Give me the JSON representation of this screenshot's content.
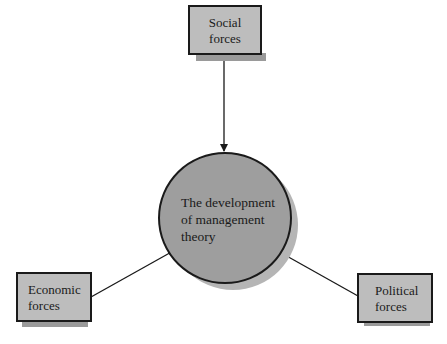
{
  "diagram": {
    "center": {
      "lines": [
        "The development",
        "of management",
        "theory"
      ]
    },
    "nodes": [
      {
        "id": "social",
        "lines": [
          "Social",
          "forces"
        ]
      },
      {
        "id": "economic",
        "lines": [
          "Economic",
          "forces"
        ]
      },
      {
        "id": "political",
        "lines": [
          "Political",
          "forces"
        ]
      }
    ],
    "edges": [
      {
        "from": "social",
        "to": "center"
      },
      {
        "from": "economic",
        "to": "center"
      },
      {
        "from": "political",
        "to": "center"
      }
    ],
    "colors": {
      "box_fill": "#bdbdbd",
      "circle_fill": "#9e9e9e",
      "shadow": "#9a9a9a",
      "stroke": "#1a1a1a"
    }
  }
}
